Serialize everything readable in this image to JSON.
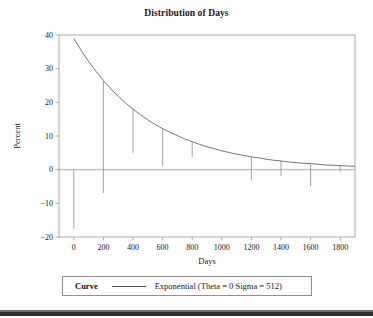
{
  "chart_data": {
    "type": "line",
    "title": "Distribution of Days",
    "xlabel": "Days",
    "ylabel": "Percent",
    "xlim": [
      -100,
      1900
    ],
    "ylim": [
      -20,
      40
    ],
    "grid": false,
    "xticks": [
      0,
      200,
      400,
      600,
      800,
      1000,
      1200,
      1400,
      1600,
      1800
    ],
    "xtick_labels": [
      "0",
      "200",
      "400",
      "600",
      "800",
      "1000",
      "1200",
      "1400",
      "1600",
      "1800"
    ],
    "yticks": [
      -20,
      -10,
      0,
      10,
      20,
      30,
      40
    ],
    "ytick_labels": [
      "−20",
      "−10",
      "0",
      "10",
      "20",
      "30",
      "40"
    ],
    "legend_position": "bottom",
    "series": [
      {
        "name": "Exponential (Theta = 0 Sigma = 512)",
        "type": "line",
        "x": [
          0,
          50,
          100,
          150,
          200,
          250,
          300,
          350,
          400,
          450,
          500,
          550,
          600,
          650,
          700,
          750,
          800,
          850,
          900,
          950,
          1000,
          1050,
          1100,
          1150,
          1200,
          1250,
          1300,
          1350,
          1400,
          1450,
          1500,
          1550,
          1600,
          1650,
          1700,
          1750,
          1800,
          1850,
          1900
        ],
        "y": [
          39.0,
          35.4,
          32.1,
          29.2,
          26.5,
          24.0,
          21.8,
          19.8,
          18.0,
          16.3,
          14.8,
          13.4,
          12.2,
          11.1,
          10.1,
          9.1,
          8.3,
          7.5,
          6.8,
          6.2,
          5.6,
          5.1,
          4.6,
          4.2,
          3.8,
          3.5,
          3.1,
          2.8,
          2.6,
          2.3,
          2.1,
          1.9,
          1.8,
          1.6,
          1.4,
          1.3,
          1.2,
          1.1,
          1.0
        ]
      },
      {
        "name": "needles",
        "type": "vertical-segments",
        "x": [
          0,
          200,
          400,
          600,
          800,
          1200,
          1400,
          1600,
          1800
        ],
        "y_top": [
          0.0,
          26.3,
          18.0,
          12.2,
          8.3,
          3.8,
          2.6,
          1.8,
          1.2
        ],
        "y_bot": [
          -17.6,
          -6.9,
          5.0,
          1.2,
          3.8,
          -3.2,
          -1.9,
          -4.9,
          -0.6
        ]
      }
    ]
  },
  "legend": {
    "label": "Curve",
    "entry": "Exponential (Theta = 0 Sigma = 512)",
    "line_color": "#555555"
  },
  "colors": {
    "curve": "#666666",
    "needle": "#8a8a8a",
    "frame": "#9a9a9a",
    "zero_line": "#9a9a9a",
    "text": "#1a1a1a",
    "background": "#fdfdfd",
    "bottom_bar": "#2d2d2d"
  }
}
